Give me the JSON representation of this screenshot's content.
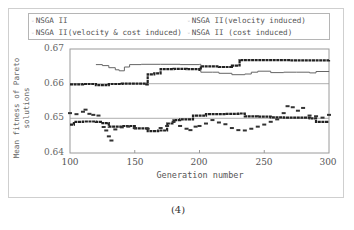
{
  "caption": "(4)",
  "chart_data": {
    "type": "scatter",
    "title": "",
    "xlabel": "Generation number",
    "ylabel_line1": "Mean fitness of Pareto",
    "ylabel_line2": "solutions",
    "xlim": [
      100,
      300
    ],
    "ylim": [
      0.64,
      0.67
    ],
    "x_ticks": [
      "100",
      "150",
      "200",
      "250",
      "300"
    ],
    "y_ticks": [
      "0.67",
      "0.66",
      "0.65",
      "0.64"
    ],
    "grid": "horizontal at 0.66 and 0.65",
    "legend_position": "top",
    "legend": [
      "NSGA II",
      "NSGA II(velocity induced)",
      "NSGA II(velocity & cost induced)",
      "NSGA II (cost induced)"
    ],
    "series": [
      {
        "name": "NSGA II(velocity induced)",
        "style": "thin",
        "points": [
          [
            120,
            0.6655
          ],
          [
            125,
            0.6652
          ],
          [
            130,
            0.6646
          ],
          [
            135,
            0.664
          ],
          [
            138,
            0.6637
          ],
          [
            142,
            0.6648
          ],
          [
            146,
            0.6655
          ],
          [
            155,
            0.6656
          ],
          [
            170,
            0.6656
          ],
          [
            185,
            0.6655
          ],
          [
            195,
            0.6655
          ],
          [
            200,
            0.6656
          ],
          [
            201,
            0.6633
          ],
          [
            210,
            0.6633
          ],
          [
            215,
            0.663
          ],
          [
            225,
            0.6626
          ],
          [
            235,
            0.6628
          ],
          [
            240,
            0.6633
          ],
          [
            245,
            0.6636
          ],
          [
            255,
            0.6632
          ],
          [
            265,
            0.6633
          ],
          [
            275,
            0.6633
          ],
          [
            285,
            0.6631
          ],
          [
            290,
            0.6635
          ],
          [
            300,
            0.6636
          ]
        ]
      },
      {
        "name": "NSGA II",
        "style": "thick",
        "points": [
          [
            100,
            0.6598
          ],
          [
            110,
            0.6599
          ],
          [
            120,
            0.6596
          ],
          [
            130,
            0.6599
          ],
          [
            140,
            0.66
          ],
          [
            150,
            0.66
          ],
          [
            159,
            0.6598
          ],
          [
            160,
            0.6627
          ],
          [
            165,
            0.663
          ],
          [
            170,
            0.6642
          ],
          [
            180,
            0.6643
          ],
          [
            190,
            0.6642
          ],
          [
            200,
            0.664
          ],
          [
            201,
            0.665
          ],
          [
            215,
            0.6648
          ],
          [
            225,
            0.6652
          ],
          [
            230,
            0.6653
          ],
          [
            231,
            0.6668
          ],
          [
            250,
            0.6668
          ],
          [
            270,
            0.6667
          ],
          [
            290,
            0.6667
          ],
          [
            300,
            0.6668
          ]
        ]
      },
      {
        "name": "NSGA II (cost induced)",
        "style": "thick",
        "points": [
          [
            100,
            0.6482
          ],
          [
            103,
            0.649
          ],
          [
            110,
            0.6491
          ],
          [
            120,
            0.649
          ],
          [
            125,
            0.6486
          ],
          [
            130,
            0.6476
          ],
          [
            140,
            0.6478
          ],
          [
            150,
            0.6471
          ],
          [
            160,
            0.6463
          ],
          [
            168,
            0.6465
          ],
          [
            175,
            0.6485
          ],
          [
            180,
            0.6495
          ],
          [
            185,
            0.6497
          ],
          [
            195,
            0.6508
          ],
          [
            205,
            0.6512
          ],
          [
            220,
            0.6513
          ],
          [
            230,
            0.6514
          ],
          [
            235,
            0.6506
          ],
          [
            245,
            0.6505
          ],
          [
            255,
            0.6503
          ],
          [
            265,
            0.6502
          ],
          [
            275,
            0.6502
          ],
          [
            285,
            0.65
          ],
          [
            290,
            0.649
          ],
          [
            300,
            0.649
          ]
        ]
      },
      {
        "name": "NSGA II(velocity & cost induced)",
        "style": "scattered",
        "points": [
          [
            100,
            0.6515
          ],
          [
            105,
            0.6512
          ],
          [
            110,
            0.6519
          ],
          [
            112,
            0.6525
          ],
          [
            115,
            0.6513
          ],
          [
            118,
            0.651
          ],
          [
            122,
            0.6508
          ],
          [
            126,
            0.6475
          ],
          [
            128,
            0.6465
          ],
          [
            130,
            0.6448
          ],
          [
            132,
            0.6436
          ],
          [
            135,
            0.6468
          ],
          [
            140,
            0.6474
          ],
          [
            145,
            0.6476
          ],
          [
            150,
            0.6472
          ],
          [
            160,
            0.647
          ],
          [
            170,
            0.6472
          ],
          [
            175,
            0.6478
          ],
          [
            180,
            0.649
          ],
          [
            185,
            0.6478
          ],
          [
            190,
            0.647
          ],
          [
            193,
            0.6466
          ],
          [
            197,
            0.6476
          ],
          [
            200,
            0.6478
          ],
          [
            205,
            0.6485
          ],
          [
            210,
            0.6495
          ],
          [
            215,
            0.6488
          ],
          [
            220,
            0.6483
          ],
          [
            225,
            0.6472
          ],
          [
            230,
            0.6466
          ],
          [
            235,
            0.6465
          ],
          [
            240,
            0.647
          ],
          [
            245,
            0.6476
          ],
          [
            250,
            0.6482
          ],
          [
            255,
            0.649
          ],
          [
            260,
            0.6497
          ],
          [
            265,
            0.6515
          ],
          [
            268,
            0.6535
          ],
          [
            272,
            0.6532
          ],
          [
            276,
            0.6522
          ],
          [
            280,
            0.653
          ],
          [
            285,
            0.6508
          ],
          [
            290,
            0.6506
          ],
          [
            295,
            0.6502
          ],
          [
            300,
            0.651
          ]
        ]
      }
    ]
  }
}
